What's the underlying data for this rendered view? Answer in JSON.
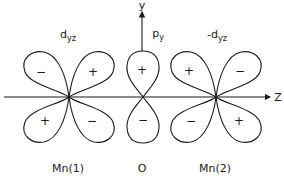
{
  "diagram": {
    "axes": {
      "z_label": "Z",
      "y_label": "y"
    },
    "orbitals": [
      {
        "id": "mn1",
        "name": "d",
        "subscript": "yz",
        "prefix": "",
        "atom_label": "Mn(1)",
        "lobe_signs": {
          "upper_left": "−",
          "upper_right": "+",
          "lower_left": "+",
          "lower_right": "−"
        }
      },
      {
        "id": "o",
        "name": "p",
        "subscript": "y",
        "prefix": "",
        "atom_label": "O",
        "lobe_signs": {
          "upper": "+",
          "lower": "−"
        }
      },
      {
        "id": "mn2",
        "name": "d",
        "subscript": "yz",
        "prefix": "-",
        "atom_label": "Mn(2)",
        "lobe_signs": {
          "upper_left": "+",
          "upper_right": "−",
          "lower_left": "−",
          "lower_right": "+"
        }
      }
    ]
  }
}
